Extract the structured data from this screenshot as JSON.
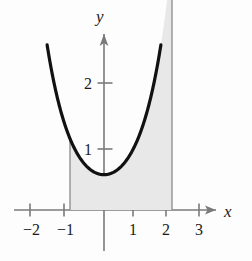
{
  "figure": {
    "background_color": "#fdfdfd",
    "width": 252,
    "height": 261,
    "axis_color": "#7a7a7a",
    "curve_color": "#111111",
    "shade_fill": "#e8e8e8",
    "shade_edge_color": "#8a8a8a",
    "text_color": "#1b1b1b"
  },
  "axes": {
    "x_label": "x",
    "y_label": "y",
    "x_ticks": [
      {
        "label": "−2",
        "value": -2,
        "px": 30
      },
      {
        "label": "−1",
        "value": -1,
        "px": 64
      },
      {
        "label": "1",
        "value": 1,
        "px": 133
      },
      {
        "label": "2",
        "value": 2,
        "px": 166
      },
      {
        "label": "3",
        "value": 3,
        "px": 199
      }
    ],
    "y_ticks": [
      {
        "label": "1",
        "value": 1,
        "px": 149
      },
      {
        "label": "2",
        "value": 2,
        "px": 83
      }
    ],
    "origin_px": {
      "x": 104,
      "y": 210
    },
    "x_unit_px": 34,
    "y_unit_px": 63,
    "x_range": [
      -2.6,
      3.5
    ],
    "y_range": [
      -0.45,
      2.75
    ],
    "grid": false,
    "legend": null
  },
  "chart_data": {
    "type": "line",
    "title": "",
    "xlabel": "x",
    "ylabel": "y",
    "grid": false,
    "legend_position": "none",
    "xlim": [
      -2.6,
      3.5
    ],
    "ylim": [
      -0.45,
      2.75
    ],
    "series": [
      {
        "name": "curve",
        "description": "U-shaped (catenary-like) curve with minimum near x = 0",
        "x": [
          -1.75,
          -1.6,
          -1.45,
          -1.3,
          -1.15,
          -1.0,
          -0.85,
          -0.7,
          -0.55,
          -0.4,
          -0.25,
          -0.1,
          0.0,
          0.1,
          0.25,
          0.4,
          0.55,
          0.7,
          0.85,
          1.0,
          1.15,
          1.3,
          1.45,
          1.6,
          1.75,
          1.9,
          2.05,
          2.2,
          2.35,
          2.5,
          2.62
        ],
        "y": [
          2.6,
          2.05,
          1.63,
          1.32,
          1.09,
          0.93,
          0.8,
          0.71,
          0.65,
          0.6,
          0.57,
          0.56,
          0.56,
          0.56,
          0.57,
          0.6,
          0.65,
          0.71,
          0.8,
          0.93,
          1.09,
          1.32,
          1.63,
          2.05,
          2.6,
          2.6,
          2.6,
          2.6,
          2.6,
          2.6,
          2.6
        ]
      }
    ],
    "shaded_region": {
      "label": "area under curve",
      "x_from": -1,
      "x_to": 2,
      "y_from": 0,
      "y_to": "curve",
      "fill": "#e8e8e8"
    },
    "annotations": []
  }
}
